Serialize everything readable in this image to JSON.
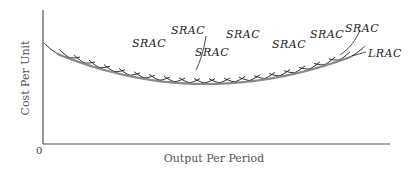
{
  "chart_data": {
    "type": "line",
    "title": "",
    "xlabel": "Output Per Period",
    "ylabel": "Cost Per Unit",
    "origin_label": "0",
    "grid": false,
    "legend": "none (curves labeled inline)",
    "series": [
      {
        "name": "LRAC",
        "description": "Long-run average cost envelope, U-shaped",
        "x": [
          0.04,
          0.2,
          0.4,
          0.5,
          0.6,
          0.8,
          0.95
        ],
        "y": [
          0.67,
          0.55,
          0.47,
          0.45,
          0.46,
          0.55,
          0.67
        ]
      },
      {
        "name": "SRAC",
        "description": "Many overlapping short-run average cost U-curves, each tangent to LRAC",
        "count": 20
      }
    ],
    "annotations": [
      {
        "text": "SRAC"
      },
      {
        "text": "SRAC"
      },
      {
        "text": "SRAC"
      },
      {
        "text": "SRAC"
      },
      {
        "text": "SRAC"
      },
      {
        "text": "SRAC"
      },
      {
        "text": "SRAC"
      },
      {
        "text": "LRAC"
      }
    ]
  },
  "labels": {
    "y_axis": "Cost Per Unit",
    "x_axis": "Output Per Period",
    "origin": "0",
    "srac": "SRAC",
    "lrac": "LRAC"
  }
}
